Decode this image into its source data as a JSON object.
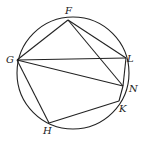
{
  "diagram": {
    "type": "inscribed-polygon-in-circle",
    "circle": {
      "cx": 73,
      "cy": 73,
      "r": 56
    },
    "stroke_color": "#222222",
    "points": {
      "F": {
        "x": 68,
        "y": 20,
        "label": "F",
        "lx": 65,
        "ly": 14
      },
      "G": {
        "x": 17,
        "y": 60,
        "label": "G",
        "lx": 6,
        "ly": 63
      },
      "L": {
        "x": 126,
        "y": 58,
        "label": "L",
        "lx": 127,
        "ly": 62
      },
      "N": {
        "x": 123,
        "y": 86,
        "label": "N",
        "lx": 129,
        "ly": 92
      },
      "K": {
        "x": 119,
        "y": 101,
        "label": "K",
        "lx": 119,
        "ly": 112
      },
      "H": {
        "x": 49,
        "y": 123,
        "label": "H",
        "lx": 43,
        "ly": 134
      }
    },
    "segments": [
      [
        "F",
        "G"
      ],
      [
        "F",
        "L"
      ],
      [
        "F",
        "N"
      ],
      [
        "G",
        "L"
      ],
      [
        "G",
        "N"
      ],
      [
        "G",
        "H"
      ],
      [
        "H",
        "K"
      ],
      [
        "K",
        "N"
      ],
      [
        "N",
        "L"
      ]
    ]
  }
}
